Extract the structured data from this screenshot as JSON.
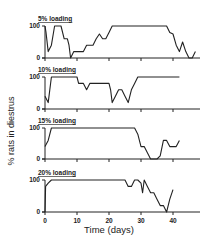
{
  "chart_data": [
    {
      "type": "line",
      "title": "5% loading",
      "xlabel": "",
      "ylabel": "% rats in diestrus",
      "ylim": [
        0,
        100
      ],
      "xlim": [
        0,
        48
      ],
      "yticks": [
        0,
        100
      ],
      "xticks": [
        0,
        10,
        20,
        30,
        40
      ],
      "grid": false,
      "x": [
        0,
        0.3,
        1,
        2,
        3,
        4,
        5,
        6,
        7,
        7.5,
        8,
        9,
        10,
        12,
        13,
        14,
        15,
        16,
        17,
        18,
        19,
        20,
        21,
        22,
        23,
        24,
        28,
        38,
        39,
        40,
        41,
        42,
        43,
        44,
        45,
        46,
        47
      ],
      "series": [
        {
          "name": "5% loading",
          "values": [
            100,
            80,
            20,
            40,
            100,
            100,
            100,
            60,
            60,
            40,
            0,
            20,
            20,
            20,
            40,
            40,
            40,
            60,
            75,
            60,
            60,
            80,
            100,
            100,
            100,
            100,
            100,
            100,
            80,
            75,
            40,
            20,
            50,
            20,
            0,
            0,
            20
          ]
        }
      ]
    },
    {
      "type": "line",
      "title": "10% loading",
      "xlabel": "",
      "ylabel": "% rats in diestrus",
      "ylim": [
        0,
        100
      ],
      "xlim": [
        0,
        48
      ],
      "yticks": [
        0,
        100
      ],
      "xticks": [
        0,
        10,
        20,
        30,
        40
      ],
      "grid": false,
      "x": [
        0,
        1,
        2,
        3,
        10,
        10.5,
        12,
        13,
        14,
        15,
        20,
        20.5,
        21,
        22,
        23,
        24,
        25,
        26,
        27,
        28,
        29,
        30,
        42
      ],
      "series": [
        {
          "name": "10% loading",
          "values": [
            40,
            20,
            100,
            100,
            100,
            80,
            80,
            60,
            80,
            80,
            80,
            60,
            20,
            40,
            60,
            60,
            40,
            20,
            60,
            80,
            100,
            100,
            100
          ]
        }
      ]
    },
    {
      "type": "line",
      "title": "15% loading",
      "xlabel": "",
      "ylabel": "% rats in diestrus",
      "ylim": [
        0,
        100
      ],
      "xlim": [
        0,
        48
      ],
      "yticks": [
        0,
        100
      ],
      "xticks": [
        0,
        10,
        20,
        30,
        40
      ],
      "grid": false,
      "x": [
        0,
        1,
        2,
        28,
        29,
        30,
        31,
        32,
        33,
        34,
        35,
        36,
        37,
        38,
        39,
        40,
        41,
        42
      ],
      "series": [
        {
          "name": "15% loading",
          "values": [
            40,
            60,
            100,
            100,
            80,
            40,
            40,
            20,
            0,
            0,
            0,
            10,
            60,
            60,
            40,
            40,
            40,
            60
          ]
        }
      ]
    },
    {
      "type": "line",
      "title": "20% loading",
      "xlabel": "Time (days)",
      "ylabel": "% rats in diestrus",
      "ylim": [
        0,
        100
      ],
      "xlim": [
        0,
        48
      ],
      "yticks": [
        0,
        100
      ],
      "xticks": [
        0,
        10,
        20,
        30,
        40
      ],
      "grid": false,
      "x": [
        0,
        0.2,
        1,
        2,
        25,
        26,
        27,
        28,
        29,
        30,
        30.5,
        31,
        32,
        33,
        34,
        35,
        36,
        37,
        38,
        39,
        40
      ],
      "series": [
        {
          "name": "20% loading",
          "values": [
            0,
            80,
            90,
            100,
            100,
            80,
            80,
            100,
            100,
            90,
            60,
            100,
            80,
            60,
            60,
            40,
            20,
            20,
            0,
            40,
            70
          ]
        }
      ]
    }
  ],
  "figure": {
    "ylabel": "% rats in diestrus",
    "xlabel": "Time (days)",
    "panels": [
      {
        "title": "5% loading",
        "y_tick_labels": [
          "100",
          "0"
        ]
      },
      {
        "title": "10% loading",
        "y_tick_labels": [
          "100",
          "0"
        ]
      },
      {
        "title": "15% loading",
        "y_tick_labels": [
          "100",
          "0"
        ]
      },
      {
        "title": "20% loading",
        "y_tick_labels": [
          "100",
          "0"
        ]
      }
    ],
    "x_tick_labels": [
      "0",
      "10",
      "20",
      "30",
      "40"
    ],
    "line_color": "#222222"
  }
}
